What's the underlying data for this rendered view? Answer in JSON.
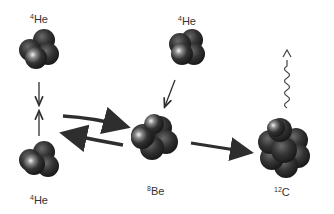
{
  "diagram": {
    "nuclei": [
      {
        "id": "he4_top_left",
        "mass": "4",
        "symbol": "He",
        "cx": 38,
        "cy": 52
      },
      {
        "id": "he4_bottom_left",
        "mass": "4",
        "symbol": "He",
        "cx": 38,
        "cy": 162
      },
      {
        "id": "he4_top_center",
        "mass": "4",
        "symbol": "He",
        "cx": 186,
        "cy": 48
      },
      {
        "id": "be8",
        "mass": "8",
        "symbol": "Be",
        "cx": 153,
        "cy": 138
      },
      {
        "id": "c12",
        "mass": "12",
        "symbol": "C",
        "cx": 284,
        "cy": 148
      }
    ],
    "labels": {
      "he4_top_left": {
        "mass": "4",
        "symbol": "He"
      },
      "he4_bottom_left": {
        "mass": "4",
        "symbol": "He"
      },
      "he4_top_center": {
        "mass": "4",
        "symbol": "He"
      },
      "be8": {
        "mass": "8",
        "symbol": "Be"
      },
      "c12": {
        "mass": "12",
        "symbol": "C"
      }
    },
    "arrows": [
      {
        "from": "he4_top_left",
        "to": "he4_bottom_left",
        "type": "straight"
      },
      {
        "from": "he4_bottom_left",
        "to": "he4_top_left",
        "type": "straight"
      },
      {
        "from": "he4_pair",
        "to": "be8",
        "type": "forward"
      },
      {
        "from": "be8",
        "to": "he4_pair",
        "type": "reverse"
      },
      {
        "from": "he4_top_center",
        "to": "be8",
        "type": "straight"
      },
      {
        "from": "be8",
        "to": "c12",
        "type": "straight"
      },
      {
        "from": "c12",
        "to": "photon",
        "type": "wavy",
        "meaning": "gamma ray emission"
      }
    ],
    "colors": {
      "nucleus_dark": "#2a2a2a",
      "nucleus_mid": "#555555",
      "highlight": "#f0f0f0",
      "arrow": "#2e2e2e"
    }
  }
}
